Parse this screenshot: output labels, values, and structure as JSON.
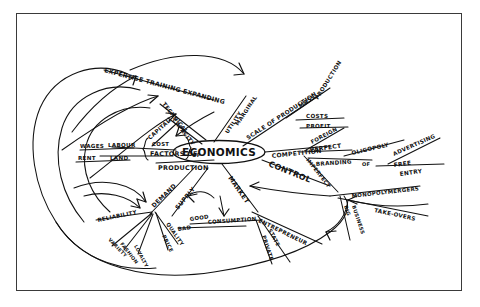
{
  "document": {
    "title": "Economics Mind Map",
    "medium": "hand-drawn ink sketch",
    "background_color": "#ffffff",
    "ink_color": "#111111",
    "frame_color": "#3a3a3a"
  },
  "central_node": {
    "label": "ECONOMICS",
    "shape": "ellipse"
  },
  "branches": {
    "factors_of_production": {
      "label": "FACTORS OF",
      "second_line": "PRODUCTION",
      "bracket_label": "COST",
      "children": [
        {
          "label": "WAGES"
        },
        {
          "label": "LABOUR"
        },
        {
          "label": "RENT"
        },
        {
          "label": "LAND"
        },
        {
          "label": "CAPITAL"
        }
      ]
    },
    "expertise": {
      "label": "EXPERTISE TRAINING EXPANDING",
      "children": [
        {
          "label": "TECHNICAL"
        },
        {
          "label": "CAPACITY"
        }
      ]
    },
    "marginal_utility": {
      "label": "MARGINAL",
      "second_line": "UTILITY"
    },
    "scale_of_production": {
      "label": "SCALE OF PRODUCTION",
      "second_label": "MASS",
      "third_label": "PRODUCTION",
      "children": [
        {
          "label": "COSTS"
        },
        {
          "label": "PROFIT"
        }
      ]
    },
    "competition": {
      "label": "COMPETITION",
      "children": [
        {
          "label": "FOREIGN"
        },
        {
          "label": "PERFECT"
        },
        {
          "label": "IMPERFECT"
        },
        {
          "label": "OLIGOPOLY"
        },
        {
          "label": "BRANDING"
        },
        {
          "label": "ADVERTISING"
        },
        {
          "label": "FREE"
        },
        {
          "label": "ENTRY"
        }
      ]
    },
    "control": {
      "label": "CONTROL",
      "children": [
        {
          "label": "MONOPOLY"
        },
        {
          "label": "MERGERS"
        },
        {
          "label": "TAKE-OVERS"
        },
        {
          "label": "BIG"
        },
        {
          "label": "BUSINESS"
        }
      ]
    },
    "market": {
      "label": "MARKET"
    },
    "demand": {
      "label": "DEMAND",
      "children": [
        {
          "label": "RELIABILITY"
        },
        {
          "label": "VARIETY"
        },
        {
          "label": "FASHION"
        },
        {
          "label": "LOYALTY"
        },
        {
          "label": "QUALITY"
        },
        {
          "label": "PRICE"
        }
      ]
    },
    "supply": {
      "label": "SUPPLY"
    },
    "consumption": {
      "label": "CONSUMPTION",
      "children": [
        {
          "label": "GOOD"
        },
        {
          "label": "BAD"
        }
      ]
    },
    "entrepreneur": {
      "label": "ENTREPRENEUR",
      "children": [
        {
          "label": "STATE"
        },
        {
          "label": "PRIVATE"
        }
      ]
    }
  }
}
